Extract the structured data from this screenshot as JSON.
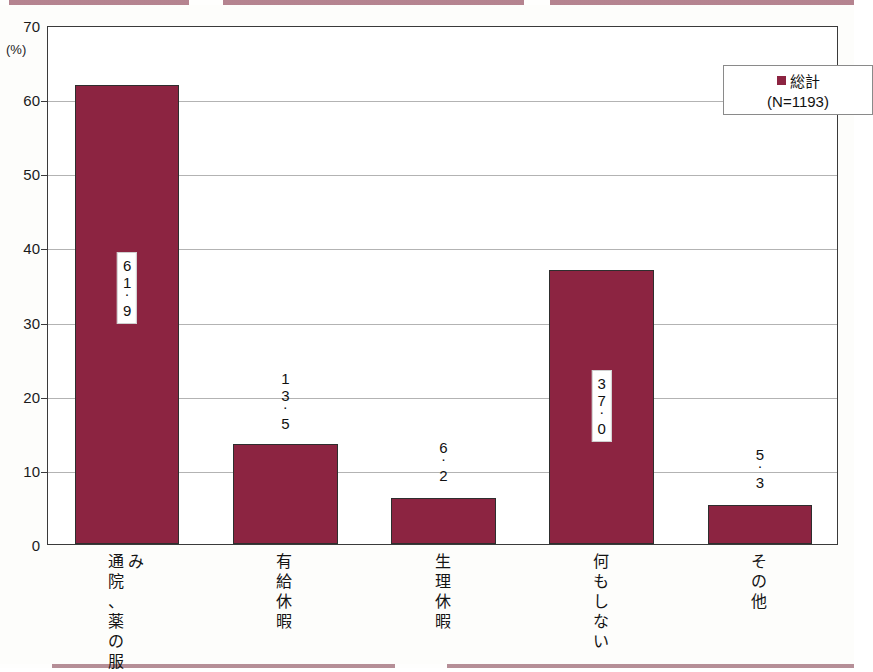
{
  "chart_data": {
    "type": "bar",
    "title": "",
    "xlabel": "",
    "ylabel": "(%)",
    "ylim": [
      0,
      70
    ],
    "yticks": [
      0,
      10,
      20,
      30,
      40,
      50,
      60,
      70
    ],
    "grid": true,
    "legend_position": "top-right",
    "categories": [
      "通院、薬の服み",
      "有給休暇",
      "生理休暇",
      "何もしない",
      "その他"
    ],
    "category_columns": [
      [
        "通院、薬の服",
        "み"
      ],
      [
        "有給休暇"
      ],
      [
        "生理休暇"
      ],
      [
        "何もしない"
      ],
      [
        "その他"
      ]
    ],
    "values": [
      61.9,
      13.5,
      6.2,
      37.0,
      5.3
    ],
    "value_labels": [
      "61.9",
      "13.5",
      "6.2",
      "37.0",
      "5.3"
    ],
    "series": [
      {
        "name": "総計",
        "values": [
          61.9,
          13.5,
          6.2,
          37.0,
          5.3
        ]
      }
    ],
    "legend": {
      "marker": "square",
      "label": "総計",
      "sublabel": "(N=1193)"
    },
    "colors": {
      "bar": "#8c2441",
      "bar_border": "#2e2e2e",
      "frame": "#3a3a3a",
      "gridline": "#9a9a9a",
      "text": "#111111",
      "background": "#ffffff"
    }
  },
  "axis": {
    "unit_label": "(%)",
    "tick_labels": [
      "70",
      "60",
      "50",
      "40",
      "30",
      "20",
      "10",
      "0"
    ]
  },
  "legend": {
    "label": "総計",
    "sublabel": "(N=1193)"
  }
}
